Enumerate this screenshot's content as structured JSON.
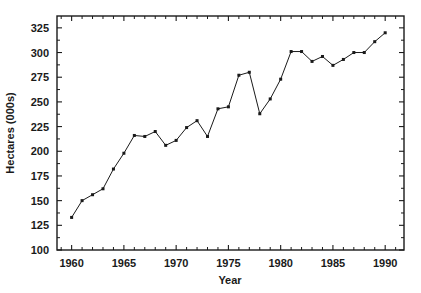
{
  "chart_data": {
    "type": "line",
    "title": "",
    "xlabel": "Year",
    "ylabel": "Hectares (000s)",
    "xlim": [
      1958.6,
      1991.8
    ],
    "ylim": [
      100,
      337
    ],
    "grid": false,
    "legend": null,
    "x_ticks_major": [
      1960,
      1965,
      1970,
      1975,
      1980,
      1985,
      1990
    ],
    "x_tick_labels": [
      "1960",
      "1965",
      "1970",
      "1975",
      "1980",
      "1985",
      "1990"
    ],
    "x_ticks_minor": [
      1959,
      1961,
      1962,
      1963,
      1964,
      1966,
      1967,
      1968,
      1969,
      1971,
      1972,
      1973,
      1974,
      1976,
      1977,
      1978,
      1979,
      1981,
      1982,
      1983,
      1984,
      1986,
      1987,
      1988,
      1989,
      1991
    ],
    "y_ticks_major": [
      100,
      125,
      150,
      175,
      200,
      225,
      250,
      275,
      300,
      325
    ],
    "y_tick_labels": [
      "100",
      "125",
      "150",
      "175",
      "200",
      "225",
      "250",
      "275",
      "300",
      "325"
    ],
    "y_ticks_minor": [
      112.5,
      137.5,
      162.5,
      187.5,
      212.5,
      237.5,
      262.5,
      287.5,
      312.5
    ],
    "marker": "square",
    "line_color": "#1a1a1a",
    "marker_color": "#1a1a1a",
    "x": [
      1960,
      1961,
      1962,
      1963,
      1964,
      1965,
      1966,
      1967,
      1968,
      1969,
      1970,
      1971,
      1972,
      1973,
      1974,
      1975,
      1976,
      1977,
      1978,
      1979,
      1980,
      1981,
      1982,
      1983,
      1984,
      1985,
      1986,
      1987,
      1988,
      1989,
      1990
    ],
    "values": [
      133,
      150,
      156,
      162,
      182,
      198,
      216,
      215,
      220,
      206,
      211,
      224,
      231,
      215,
      243,
      245,
      277,
      280,
      238,
      253,
      273,
      301,
      301,
      291,
      296,
      287,
      293,
      300,
      300,
      311,
      320
    ],
    "series": [
      {
        "name": "Hectares (000s)",
        "values": [
          133,
          150,
          156,
          162,
          182,
          198,
          216,
          215,
          220,
          206,
          211,
          224,
          231,
          215,
          243,
          245,
          277,
          280,
          238,
          253,
          273,
          301,
          301,
          291,
          296,
          287,
          293,
          300,
          300,
          311,
          320
        ]
      }
    ]
  },
  "axes": {
    "x_title": "Year",
    "y_title": "Hectares (000s)"
  }
}
